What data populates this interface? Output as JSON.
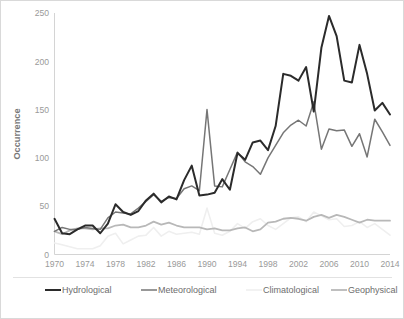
{
  "chart_data": {
    "type": "line",
    "title": "",
    "xlabel": "",
    "ylabel": "Occurrence",
    "xlim": [
      1970,
      2014
    ],
    "ylim": [
      0,
      250
    ],
    "ytick_values": [
      0,
      50,
      100,
      150,
      200,
      250
    ],
    "ytick_labels": [
      "0",
      "50",
      "100",
      "150",
      "200",
      "250"
    ],
    "xtick_values": [
      1970,
      1974,
      1978,
      1982,
      1986,
      1990,
      1994,
      1998,
      2002,
      2006,
      2010,
      2014
    ],
    "xtick_labels": [
      "1970",
      "1974",
      "1978",
      "1982",
      "1986",
      "1990",
      "1994",
      "1998",
      "2002",
      "2006",
      "2010",
      "2014"
    ],
    "grid": false,
    "legend_position": "bottom",
    "x": [
      1970,
      1971,
      1972,
      1973,
      1974,
      1975,
      1976,
      1977,
      1978,
      1979,
      1980,
      1981,
      1982,
      1983,
      1984,
      1985,
      1986,
      1987,
      1988,
      1989,
      1990,
      1991,
      1992,
      1993,
      1994,
      1995,
      1996,
      1997,
      1998,
      1999,
      2000,
      2001,
      2002,
      2003,
      2004,
      2005,
      2006,
      2007,
      2008,
      2009,
      2010,
      2011,
      2012,
      2013,
      2014
    ],
    "series": [
      {
        "name": "Hydrological",
        "color": "#2b2b2b",
        "width": 2.0,
        "values": [
          37,
          22,
          21,
          26,
          30,
          30,
          22,
          32,
          52,
          44,
          41,
          45,
          56,
          63,
          54,
          60,
          57,
          77,
          92,
          61,
          62,
          64,
          78,
          67,
          105,
          98,
          116,
          118,
          108,
          133,
          187,
          185,
          180,
          194,
          148,
          214,
          247,
          226,
          180,
          178,
          217,
          187,
          149,
          157,
          145
        ]
      },
      {
        "name": "Meteorological",
        "color": "#767676",
        "width": 1.5,
        "values": [
          24,
          28,
          26,
          26,
          28,
          27,
          26,
          38,
          44,
          43,
          42,
          48,
          55,
          62,
          55,
          59,
          58,
          68,
          71,
          66,
          150,
          71,
          70,
          88,
          106,
          96,
          91,
          83,
          100,
          113,
          126,
          134,
          139,
          133,
          158,
          109,
          130,
          128,
          129,
          112,
          125,
          101,
          140,
          127,
          113
        ]
      },
      {
        "name": "Climatological",
        "color": "#efefef",
        "width": 1.6,
        "values": [
          12,
          10,
          8,
          6,
          6,
          6,
          9,
          19,
          22,
          11,
          15,
          19,
          20,
          28,
          19,
          24,
          21,
          22,
          23,
          21,
          48,
          22,
          20,
          24,
          32,
          27,
          34,
          37,
          30,
          26,
          32,
          38,
          39,
          34,
          44,
          40,
          36,
          37,
          29,
          30,
          34,
          28,
          32,
          26,
          20
        ]
      },
      {
        "name": "Geophysical",
        "color": "#b8b8b8",
        "width": 1.8,
        "values": [
          24,
          21,
          25,
          27,
          27,
          26,
          27,
          27,
          30,
          31,
          28,
          28,
          30,
          34,
          31,
          33,
          30,
          28,
          28,
          28,
          26,
          27,
          25,
          25,
          27,
          28,
          24,
          26,
          33,
          34,
          37,
          38,
          37,
          35,
          39,
          41,
          38,
          41,
          39,
          36,
          33,
          36,
          35,
          35,
          35
        ]
      }
    ],
    "legend_entries": [
      {
        "label": "Hydrological",
        "color": "#2b2b2b"
      },
      {
        "label": "Meteorological",
        "color": "#767676"
      },
      {
        "label": "Climatological",
        "color": "#efefef"
      },
      {
        "label": "Geophysical",
        "color": "#b8b8b8"
      }
    ]
  }
}
